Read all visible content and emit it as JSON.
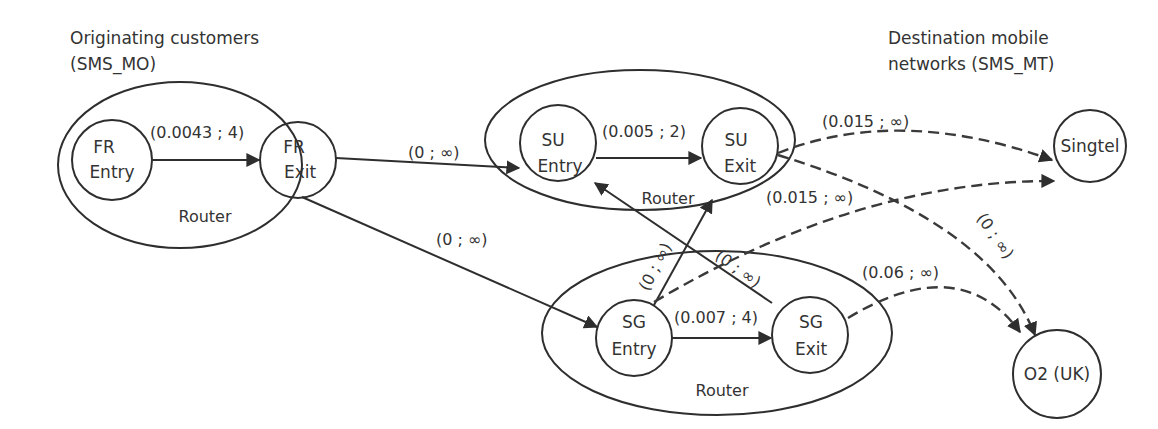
{
  "headings": {
    "origin_line1": "Originating customers",
    "origin_line2": "(SMS_MO)",
    "dest_line1": "Destination mobile",
    "dest_line2": "networks (SMS_MT)"
  },
  "routers": {
    "fr": {
      "label": "Router",
      "entry": [
        "FR",
        "Entry"
      ],
      "exit": [
        "FR",
        "Exit"
      ]
    },
    "su": {
      "label": "Router",
      "entry": [
        "SU",
        "Entry"
      ],
      "exit": [
        "SU",
        "Exit"
      ]
    },
    "sg": {
      "label": "Router",
      "entry": [
        "SG",
        "Entry"
      ],
      "exit": [
        "SG",
        "Exit"
      ]
    }
  },
  "destinations": {
    "singtel": "Singtel",
    "o2": "O2 (UK)"
  },
  "edges": {
    "fr_entry_to_fr_exit": "(0.0043 ; 4)",
    "fr_exit_to_su_entry": "(0 ; ∞)",
    "fr_exit_to_sg_entry": "(0 ; ∞)",
    "su_entry_to_su_exit": "(0.005 ; 2)",
    "sg_entry_to_sg_exit": "(0.007 ; 4)",
    "sg_entry_to_su_exit": "(0 ; ∞)",
    "sg_exit_to_su_entry": "(0 ; ∞)",
    "su_exit_to_singtel": "(0.015 ; ∞)",
    "sg_entry_to_singtel": "(0.015 ; ∞)",
    "su_exit_to_o2": "(0 ; ∞)",
    "sg_exit_to_o2": "(0.06 ; ∞)"
  },
  "colors": {
    "line": "#2e2e2e",
    "text": "#333333",
    "background": "#ffffff"
  }
}
